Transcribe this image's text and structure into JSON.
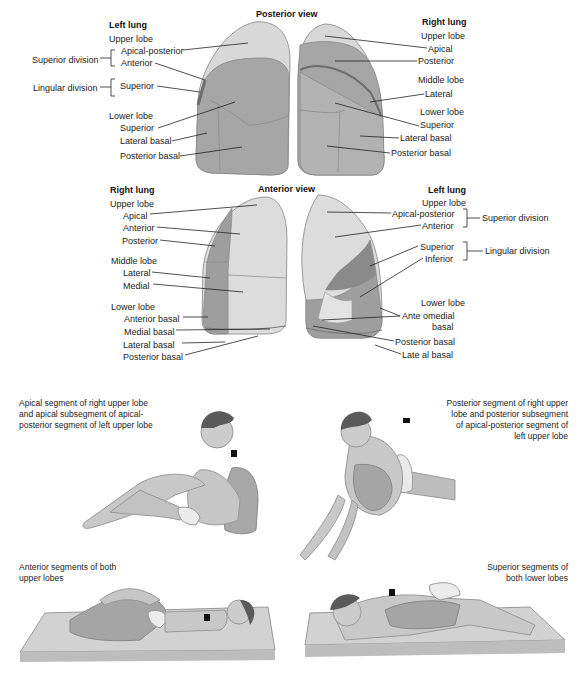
{
  "posterior_view": {
    "title": "Posterior view",
    "left_lung": {
      "heading": "Left lung",
      "upper_lobe": "Upper lobe",
      "superior_division": "Superior division",
      "apical_posterior": "Apical-posterior",
      "anterior": "Anterior",
      "lingular_division": "Lingular division",
      "superior_lingular": "Superior",
      "lower_lobe": "Lower lobe",
      "superior": "Superior",
      "lateral_basal": "Lateral basal",
      "posterior_basal": "Posterior basal"
    },
    "right_lung": {
      "heading": "Right lung",
      "upper_lobe": "Upper lobe",
      "apical": "Apical",
      "posterior": "Posterior",
      "middle_lobe": "Middle lobe",
      "lateral": "Lateral",
      "lower_lobe": "Lower lobe",
      "superior": "Superior",
      "lateral_basal": "Lateral  basal",
      "posterior_basal": "Posterior  basal"
    }
  },
  "anterior_view": {
    "title": "Anterior view",
    "right_lung": {
      "heading": "Right lung",
      "upper_lobe": "Upper lobe",
      "apical": "Apical",
      "anterior": "Anterior",
      "posterior": "Posterior",
      "middle_lobe": "Middle lobe",
      "lateral": "Lateral",
      "medial": "Medial",
      "lower_lobe": "Lower lobe",
      "anterior_basal": "Anterior basal",
      "medial_basal": "Medial basal",
      "lateral_basal": "Lateral basal",
      "posterior_basal": "Posterior basal"
    },
    "left_lung": {
      "heading": "Left lung",
      "upper_lobe": "Upper lobe",
      "apical_posterior": "Apical-posterior",
      "anterior": "Anterior",
      "superior_division": "Superior division",
      "superior": "Superior",
      "inferior": "Inferior",
      "lingular_division": "Lingular division",
      "lower_lobe": "Lower lobe",
      "anteromedial_basal_line1": "Ante omedial",
      "anteromedial_basal_line2": "basal",
      "posterior_basal": "Posterior basal",
      "lateral_basal": "Late al basal"
    }
  },
  "positions": [
    {
      "id": "apical",
      "caption": [
        "Apical segment of right upper lobe",
        "and apical subsegment of apical-",
        "posterior segment of left upper lobe"
      ]
    },
    {
      "id": "posterior",
      "caption": [
        "Posterior segment of right upper",
        "lobe and posterior subsegment",
        "of apical-posterior segment of",
        "left upper lobe"
      ]
    },
    {
      "id": "anterior",
      "caption": [
        "Anterior segments of both",
        "upper lobes"
      ]
    },
    {
      "id": "superior",
      "caption": [
        "Superior segments of",
        "both lower lobes"
      ]
    }
  ],
  "colors": {
    "lung_light": "#d9d9d9",
    "lung_mid": "#b3b3b3",
    "lung_dark": "#8f8f8f",
    "skin": "#c8c8c8",
    "hair": "#555555",
    "marker": "#111111"
  }
}
